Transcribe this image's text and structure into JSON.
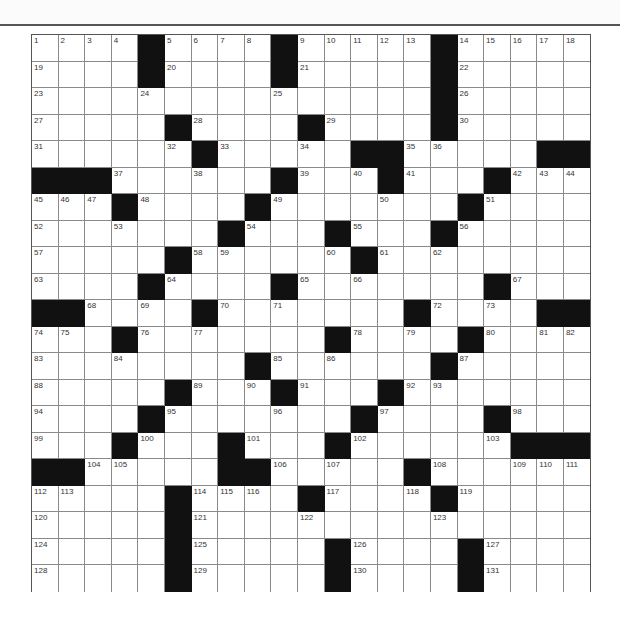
{
  "puzzle": {
    "rows": 21,
    "cols": 21,
    "colors": {
      "black_cell": "#111111",
      "white_cell": "#ffffff",
      "grid_line": "#8a8a8a",
      "number": "#333333"
    },
    "grid": [
      [
        "1",
        "2",
        "3",
        "4",
        "#",
        "5",
        "6",
        "7",
        "8",
        "#",
        "9",
        "10",
        "11",
        "12",
        "13",
        "#",
        "14",
        "15",
        "16",
        "17",
        "18"
      ],
      [
        "19",
        "",
        "",
        "",
        "#",
        "20",
        "",
        "",
        "",
        "#",
        "21",
        "",
        "",
        "",
        "",
        "#",
        "22",
        "",
        "",
        "",
        ""
      ],
      [
        "23",
        "",
        "",
        "",
        "24",
        "",
        "",
        "",
        "",
        "25",
        "",
        "",
        "",
        "",
        "",
        "#",
        "26",
        "",
        "",
        "",
        ""
      ],
      [
        "27",
        "",
        "",
        "",
        "",
        "#",
        "28",
        "",
        "",
        "",
        "#",
        "29",
        "",
        "",
        "",
        "#",
        "30",
        "",
        "",
        "",
        ""
      ],
      [
        "31",
        "",
        "",
        "",
        "",
        "32",
        "#",
        "33",
        "",
        "",
        "34",
        "",
        "#",
        "#",
        "35",
        "36",
        "",
        "",
        "",
        "#",
        "#"
      ],
      [
        "#",
        "#",
        "#",
        "37",
        "",
        "",
        "38",
        "",
        "",
        "#",
        "39",
        "",
        "40",
        "#",
        "41",
        "",
        "",
        "#",
        "42",
        "43",
        "44"
      ],
      [
        "45",
        "46",
        "47",
        "#",
        "48",
        "",
        "",
        "",
        "#",
        "49",
        "",
        "",
        "",
        "50",
        "",
        "",
        "#",
        "51",
        "",
        "",
        ""
      ],
      [
        "52",
        "",
        "",
        "53",
        "",
        "",
        "",
        "#",
        "54",
        "",
        "",
        "#",
        "55",
        "",
        "",
        "#",
        "56",
        "",
        "",
        "",
        ""
      ],
      [
        "57",
        "",
        "",
        "",
        "",
        "#",
        "58",
        "59",
        "",
        "",
        "",
        "60",
        "#",
        "61",
        "",
        "62",
        "",
        "",
        "",
        "",
        ""
      ],
      [
        "63",
        "",
        "",
        "",
        "#",
        "64",
        "",
        "",
        "",
        "#",
        "65",
        "",
        "66",
        "",
        "",
        "",
        "",
        "#",
        "67",
        "",
        ""
      ],
      [
        "#",
        "#",
        "68",
        "",
        "69",
        "",
        "#",
        "70",
        "",
        "71",
        "",
        "",
        "",
        "",
        "#",
        "72",
        "",
        "73",
        "",
        "#",
        "#"
      ],
      [
        "74",
        "75",
        "",
        "#",
        "76",
        "",
        "77",
        "",
        "",
        "",
        "",
        "#",
        "78",
        "",
        "79",
        "",
        "#",
        "80",
        "",
        "81",
        "82"
      ],
      [
        "83",
        "",
        "",
        "84",
        "",
        "",
        "",
        "",
        "#",
        "85",
        "",
        "86",
        "",
        "",
        "",
        "#",
        "87",
        "",
        "",
        "",
        ""
      ],
      [
        "88",
        "",
        "",
        "",
        "",
        "#",
        "89",
        "",
        "90",
        "#",
        "91",
        "",
        "",
        "#",
        "92",
        "93",
        "",
        "",
        "",
        "",
        ""
      ],
      [
        "94",
        "",
        "",
        "",
        "#",
        "95",
        "",
        "",
        "",
        "96",
        "",
        "",
        "#",
        "97",
        "",
        "",
        "",
        "#",
        "98",
        "",
        ""
      ],
      [
        "99",
        "",
        "",
        "#",
        "100",
        "",
        "",
        "#",
        "101",
        "",
        "",
        "#",
        "102",
        "",
        "",
        "",
        "",
        "103",
        "#",
        "#",
        "#"
      ],
      [
        "#",
        "#",
        "104",
        "105",
        "",
        "",
        "",
        "#",
        "#",
        "106",
        "",
        "107",
        "",
        "",
        "#",
        "108",
        "",
        "",
        "109",
        "110",
        "111"
      ],
      [
        "112",
        "113",
        "",
        "",
        "",
        "#",
        "114",
        "115",
        "116",
        "",
        "#",
        "117",
        "",
        "",
        "118",
        "#",
        "119",
        "",
        "",
        "",
        ""
      ],
      [
        "120",
        "",
        "",
        "",
        "",
        "#",
        "121",
        "",
        "",
        "",
        "122",
        "",
        "",
        "",
        "",
        "123",
        "",
        "",
        "",
        "",
        ""
      ],
      [
        "124",
        "",
        "",
        "",
        "",
        "#",
        "125",
        "",
        "",
        "",
        "",
        "#",
        "126",
        "",
        "",
        "",
        "#",
        "127",
        "",
        "",
        ""
      ],
      [
        "128",
        "",
        "",
        "",
        "",
        "#",
        "129",
        "",
        "",
        "",
        "",
        "#",
        "130",
        "",
        "",
        "",
        "#",
        "131",
        "",
        "",
        ""
      ]
    ]
  }
}
